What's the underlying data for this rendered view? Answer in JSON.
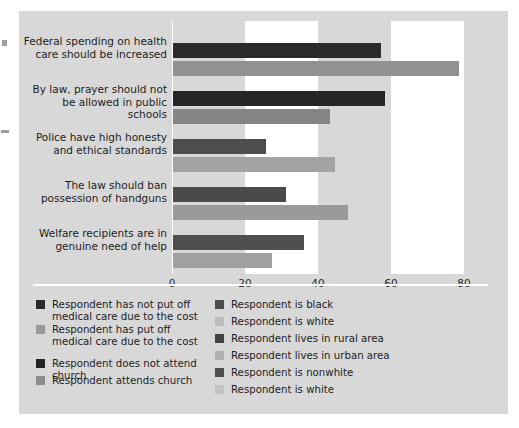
{
  "chart_data": {
    "type": "bar",
    "orientation": "horizontal",
    "title": "",
    "subtitle": "",
    "xlabel": "",
    "ylabel": "",
    "xlim": [
      0,
      85.5
    ],
    "xticks": [
      0,
      20,
      40,
      60,
      80
    ],
    "xtick_labels": [
      "0",
      "20",
      "40",
      "60",
      "80"
    ],
    "grid": false,
    "alternating_bands": true,
    "band_edges": [
      0,
      20,
      40,
      60,
      80
    ],
    "band_colors": [
      "#d8d8d8",
      "#ffffff",
      "#d8d8d8",
      "#ffffff"
    ],
    "legend_position": "below-plot",
    "categories": [
      "Federal spending on health\ncare should be increased",
      "By law, prayer should not be\nallowed in public schools",
      "Police have high honesty and\nethical standards",
      "The law should ban\npossession of handguns",
      "Welfare recipients are in\ngenuine need of help"
    ],
    "groups": [
      {
        "category": "Federal spending on health care should be increased",
        "bars": [
          {
            "series": "Respondent has not put off medical care due to the cost",
            "value": 57.0,
            "color": "#2a2a2a"
          },
          {
            "series": "Respondent has put off medical care due to the cost",
            "value": 78.5,
            "color": "#919191"
          }
        ]
      },
      {
        "category": "By law, prayer should not be allowed in public schools",
        "bars": [
          {
            "series": "Respondent does not attend church",
            "value": 58.0,
            "color": "#262626"
          },
          {
            "series": "Respondent attends church",
            "value": 43.0,
            "color": "#858585"
          }
        ]
      },
      {
        "category": "Police have high honesty and ethical standards",
        "bars": [
          {
            "series": "Respondent is black",
            "value": 25.5,
            "color": "#4d4d4d"
          },
          {
            "series": "Respondent is white",
            "value": 44.5,
            "color": "#a3a3a3"
          }
        ]
      },
      {
        "category": "The law should ban possession of handguns",
        "bars": [
          {
            "series": "Respondent lives in rural area",
            "value": 31.0,
            "color": "#4a4a4a"
          },
          {
            "series": "Respondent lives in urban area",
            "value": 48.0,
            "color": "#9a9a9a"
          }
        ]
      },
      {
        "category": "Welfare recipients are in genuine need of help",
        "bars": [
          {
            "series": "Respondent is nonwhite",
            "value": 36.0,
            "color": "#4f4f4f"
          },
          {
            "series": "Respondent is white",
            "value": 27.0,
            "color": "#a0a0a0"
          }
        ]
      }
    ]
  },
  "legend": {
    "left_column": [
      {
        "label": "Respondent has not put off\nmedical care due to the cost",
        "color": "#2a2a2a"
      },
      {
        "label": "Respondent has put off\nmedical care due to the cost",
        "color": "#9a9a9a"
      },
      {
        "label": "Respondent does not attend church",
        "color": "#232323"
      },
      {
        "label": "Respondent attends church",
        "color": "#8d8d8d"
      }
    ],
    "right_column": [
      {
        "label": "Respondent is black",
        "color": "#4d4d4d"
      },
      {
        "label": "Respondent is white",
        "color": "#bcbcbc"
      },
      {
        "label": "Respondent lives in rural area",
        "color": "#434343"
      },
      {
        "label": "Respondent lives in urban area",
        "color": "#b0b0b0"
      },
      {
        "label": "Respondent is nonwhite",
        "color": "#4f4f4f"
      },
      {
        "label": "Respondent is white",
        "color": "#c2c2c2"
      }
    ]
  },
  "colors": {
    "panel_background": "#d8d8d8",
    "band_white": "#ffffff",
    "band_gray": "#d8d8d8",
    "text": "#1d1d1d",
    "axis": "#ffffff"
  }
}
